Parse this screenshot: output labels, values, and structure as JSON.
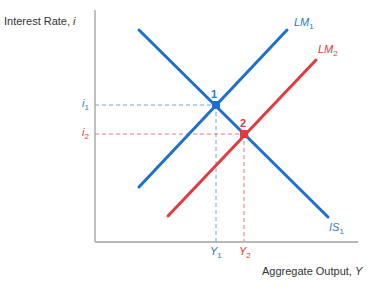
{
  "colors": {
    "blue": "#1f6fcf",
    "red": "#e23a3f",
    "axis": "#999999",
    "text": "#333333"
  },
  "axes": {
    "y_label": "Interest Rate, ",
    "y_label_var": "i",
    "x_label": "Aggregate Output, ",
    "x_label_var": "Y"
  },
  "curves": {
    "is1": {
      "name": "IS",
      "sub": "1"
    },
    "lm1": {
      "name": "LM",
      "sub": "1"
    },
    "lm2": {
      "name": "LM",
      "sub": "2"
    }
  },
  "equilibria": {
    "p1": {
      "label": "1",
      "i": "i",
      "i_sub": "1",
      "y": "Y",
      "y_sub": "1"
    },
    "p2": {
      "label": "2",
      "i": "i",
      "i_sub": "2",
      "y": "Y",
      "y_sub": "2"
    }
  }
}
